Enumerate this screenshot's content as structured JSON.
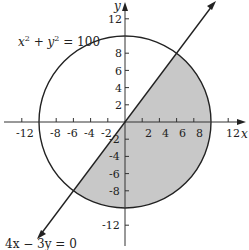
{
  "diagram": {
    "title": "",
    "axes": {
      "x_label": "x",
      "y_label": "y",
      "x_ticks": [
        "-12",
        "-8",
        "-6",
        "-4",
        "-2",
        "2",
        "4",
        "6",
        "8",
        "12"
      ],
      "y_ticks": [
        "12",
        "8",
        "6",
        "4",
        "2",
        "-2",
        "-4",
        "-6",
        "-8",
        "-12"
      ]
    },
    "curves": {
      "circle_equation": "x² + y² = 100",
      "circle_eq_base1": "x",
      "circle_eq_exp1": "2",
      "circle_eq_mid": " + ",
      "circle_eq_base2": "y",
      "circle_eq_exp2": "2",
      "circle_eq_rhs": " = 100",
      "line_equation": "4x − 3y = 0"
    },
    "shaded_region": "Region of disk x²+y²≤100 below/right of line 4x−3y=0",
    "colors": {
      "shade": "#c8c8c8",
      "stroke": "#222222"
    }
  }
}
